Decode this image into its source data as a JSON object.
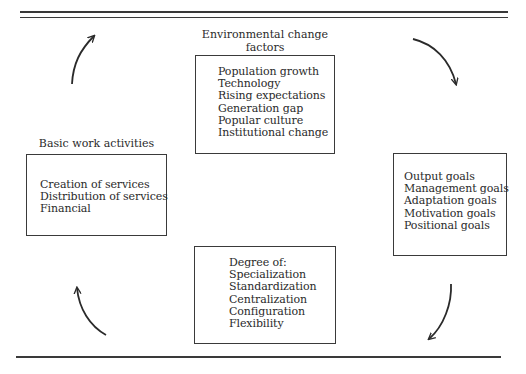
{
  "diagram": {
    "type": "cycle",
    "nodes": {
      "environmental_factors": {
        "title_line1": "Environmental change",
        "title_line2": "factors",
        "items": [
          "Population growth",
          "Technology",
          "Rising expectations",
          "Generation gap",
          "Popular culture",
          "Institutional change"
        ]
      },
      "goals": {
        "items": [
          "Output goals",
          "Management goals",
          "Adaptation goals",
          "Motivation goals",
          "Positional goals"
        ]
      },
      "structure": {
        "items": [
          "Degree of:",
          "Specialization",
          "Standardization",
          "Centralization",
          "Configuration",
          "Flexibility"
        ]
      },
      "work_activities": {
        "title": "Basic work activities",
        "items": [
          "Creation of services",
          "Distribution of services",
          "Financial"
        ]
      }
    },
    "edges": [
      {
        "from": "environmental_factors",
        "to": "goals",
        "direction": "clockwise"
      },
      {
        "from": "goals",
        "to": "structure",
        "direction": "clockwise"
      },
      {
        "from": "structure",
        "to": "work_activities",
        "direction": "clockwise"
      },
      {
        "from": "work_activities",
        "to": "environmental_factors",
        "direction": "clockwise"
      }
    ],
    "colors": {
      "ink": "#2a2a2a",
      "background": "#ffffff"
    }
  }
}
